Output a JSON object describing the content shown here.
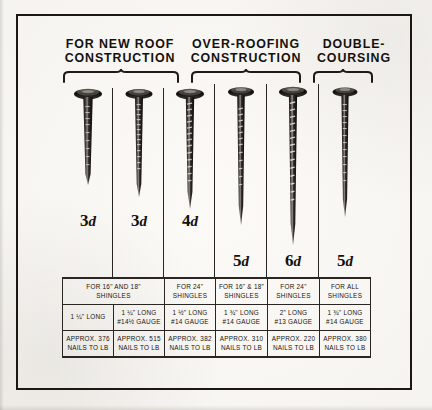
{
  "figure": {
    "headings": [
      {
        "id": "new-roof",
        "label": "FOR NEW ROOF\nCONSTRUCTION"
      },
      {
        "id": "over-roofing",
        "label": "OVER-ROOFING\nCONSTRUCTION"
      },
      {
        "id": "double",
        "label": "DOUBLE-\nCOURSING"
      }
    ],
    "penny_sizes": [
      {
        "number": "3",
        "unit": "d"
      },
      {
        "number": "3",
        "unit": "d"
      },
      {
        "number": "4",
        "unit": "d"
      },
      {
        "number": "5",
        "unit": "d"
      },
      {
        "number": "6",
        "unit": "d"
      },
      {
        "number": "5",
        "unit": "d"
      }
    ],
    "table": {
      "shingles_row": [
        {
          "text": "FOR 16\" AND 18\"\nSHINGLES",
          "span": 2
        },
        {
          "text": "FOR 24\"\nSHINGLES",
          "span": 1
        },
        {
          "text": "FOR 16\" & 18\"\nSHINGLES",
          "span": 1
        },
        {
          "text": "FOR 24\"\nSHINGLES",
          "span": 1
        },
        {
          "text": "FOR ALL\nSHINGLES",
          "span": 1
        }
      ],
      "spec_row": [
        {
          "text": "1 ¼\" LONG",
          "span": 1
        },
        {
          "text": "1 ¼\" LONG\n#14½ GAUGE",
          "span": 1
        },
        {
          "text": "1 ½\" LONG\n#14 GAUGE",
          "span": 1
        },
        {
          "text": "1 ¾\" LONG\n#14 GAUGE",
          "span": 1
        },
        {
          "text": "2\" LONG\n#13 GAUGE",
          "span": 1
        },
        {
          "text": "1 ¾\" LONG\n#14 GAUGE",
          "span": 1
        }
      ],
      "count_row": [
        {
          "text": "APPROX. 376\nNAILS TO LB",
          "span": 1
        },
        {
          "text": "APPROX. 515\nNAILS TO LB",
          "span": 1
        },
        {
          "text": "APPROX. 382\nNAILS TO LB",
          "span": 1
        },
        {
          "text": "APPROX. 310\nNAILS TO LB",
          "span": 1
        },
        {
          "text": "APPROX. 220\nNAILS TO LB",
          "span": 1
        },
        {
          "text": "APPROX. 380\nNAILS TO LB",
          "span": 1
        }
      ]
    },
    "colors": {
      "ink": "#14110d",
      "rule": "#2b2622",
      "paper": "#fbfaf7"
    }
  }
}
